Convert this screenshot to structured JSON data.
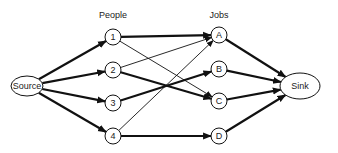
{
  "diagram": {
    "type": "bipartite-flow-network",
    "column_labels": {
      "people": "People",
      "jobs": "Jobs"
    },
    "nodes": {
      "source": {
        "label": "Source",
        "cx": 27,
        "cy": 86,
        "rx": 16,
        "ry": 10
      },
      "sink": {
        "label": "Sink",
        "cx": 300,
        "cy": 86,
        "rx": 20,
        "ry": 13
      },
      "people": [
        {
          "id": "1",
          "label": "1",
          "cx": 113,
          "cy": 37
        },
        {
          "id": "2",
          "label": "2",
          "cx": 113,
          "cy": 70
        },
        {
          "id": "3",
          "label": "3",
          "cx": 113,
          "cy": 103
        },
        {
          "id": "4",
          "label": "4",
          "cx": 113,
          "cy": 136
        }
      ],
      "jobs": [
        {
          "id": "A",
          "label": "A",
          "cx": 219,
          "cy": 35
        },
        {
          "id": "B",
          "label": "B",
          "cx": 219,
          "cy": 69
        },
        {
          "id": "C",
          "label": "C",
          "cx": 219,
          "cy": 101
        },
        {
          "id": "D",
          "label": "D",
          "cx": 219,
          "cy": 136
        }
      ]
    },
    "edges": [
      {
        "from": "Source",
        "to": "1",
        "weight": "thick"
      },
      {
        "from": "Source",
        "to": "2",
        "weight": "thick"
      },
      {
        "from": "Source",
        "to": "3",
        "weight": "thick"
      },
      {
        "from": "Source",
        "to": "4",
        "weight": "thick"
      },
      {
        "from": "1",
        "to": "A",
        "weight": "thick"
      },
      {
        "from": "1",
        "to": "C",
        "weight": "thin"
      },
      {
        "from": "2",
        "to": "A",
        "weight": "thin"
      },
      {
        "from": "2",
        "to": "C",
        "weight": "thick"
      },
      {
        "from": "3",
        "to": "B",
        "weight": "thick"
      },
      {
        "from": "4",
        "to": "A",
        "weight": "thin"
      },
      {
        "from": "4",
        "to": "D",
        "weight": "thick"
      },
      {
        "from": "A",
        "to": "Sink",
        "weight": "thick"
      },
      {
        "from": "B",
        "to": "Sink",
        "weight": "thick"
      },
      {
        "from": "C",
        "to": "Sink",
        "weight": "thick"
      },
      {
        "from": "D",
        "to": "Sink",
        "weight": "thick"
      }
    ],
    "colors": {
      "stroke": "#111111",
      "fill": "#ffffff",
      "text": "#222222"
    }
  }
}
